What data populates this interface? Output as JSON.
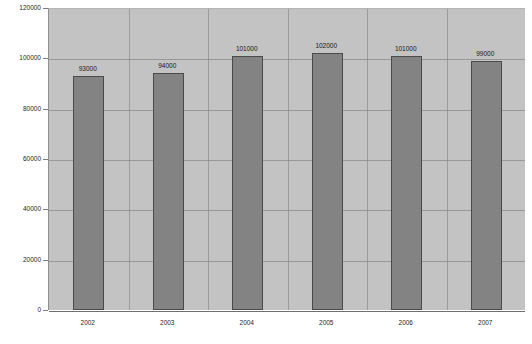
{
  "chart_data": {
    "type": "bar",
    "title": "",
    "subtitle": "",
    "xlabel": "",
    "ylabel": "",
    "categories": [
      "2002",
      "2003",
      "2004",
      "2005",
      "2006",
      "2007"
    ],
    "values": [
      93000,
      94000,
      101000,
      102000,
      101000,
      99000
    ],
    "data_labels": [
      "93000",
      "94000",
      "101000",
      "102000",
      "101000",
      "99000"
    ],
    "ylim": [
      0,
      120000
    ],
    "ytick_step": 20000,
    "ytick_labels": [
      "120000",
      "100000",
      "80000",
      "60000",
      "40000",
      "20000",
      "0"
    ],
    "ytick_values": [
      120000,
      100000,
      80000,
      60000,
      40000,
      20000,
      0
    ],
    "grid": {
      "horizontal": true,
      "vertical": true
    },
    "legend": {
      "visible": false,
      "position": "none",
      "entries": []
    },
    "series": [
      {
        "name": "",
        "values": [
          93000,
          94000,
          101000,
          102000,
          101000,
          99000
        ]
      }
    ],
    "colors": {
      "bar_fill": "#838383",
      "bar_border": "#4a4a4a",
      "plot_background": "#c3c3c3",
      "gridline": "#8a8a8a",
      "page_background": "#ffffff",
      "text": "#1c1c1c"
    }
  }
}
